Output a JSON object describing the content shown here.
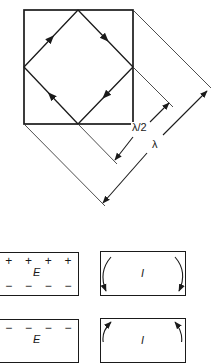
{
  "diagram": {
    "colors": {
      "stroke": "#1a1a1a",
      "thin_stroke": "#3a3a3a",
      "background": "#ffffff"
    },
    "square": {
      "x1": 24,
      "y1": 10,
      "x2": 133,
      "y2": 124
    },
    "diamond_path": {
      "vertices": [
        [
          78,
          10
        ],
        [
          133,
          67
        ],
        [
          78,
          124
        ],
        [
          24,
          67
        ]
      ],
      "arrow_direction": "clockwise",
      "arrows": [
        "up-right on left-top edge",
        "down-right on top-right edge",
        "down-left on right-bottom edge",
        "up-left on bottom-left edge"
      ]
    },
    "dimensions": [
      {
        "id": "half-wavelength",
        "label": "λ/2"
      },
      {
        "id": "wavelength",
        "label": "λ"
      }
    ],
    "mode_boxes": [
      {
        "id": "e-field-box-1",
        "top_signs": [
          "+",
          "+",
          "+",
          "+"
        ],
        "bottom_signs": [
          "−",
          "−",
          "−",
          "−"
        ],
        "field_label": "E"
      },
      {
        "id": "current-box-1",
        "field_label": "I",
        "arrow_direction": "downward on both sides"
      },
      {
        "id": "e-field-box-2",
        "top_signs": [
          "−",
          "−",
          "−",
          "−"
        ],
        "field_label": "E"
      },
      {
        "id": "current-box-2",
        "field_label": "I",
        "arrow_direction": "upward on both sides"
      }
    ]
  }
}
